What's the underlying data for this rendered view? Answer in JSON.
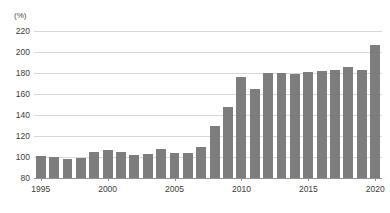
{
  "chart_data": {
    "type": "bar",
    "title": "",
    "subtitle": "",
    "xlabel": "",
    "ylabel": "",
    "unit_label": "(%)",
    "ylim": [
      80,
      220
    ],
    "ytick_values": [
      80,
      100,
      120,
      140,
      160,
      180,
      200,
      220
    ],
    "ytick_labels": [
      "80",
      "100",
      "120",
      "140",
      "160",
      "180",
      "200",
      "220"
    ],
    "xtick_values": [
      1995,
      2000,
      2005,
      2010,
      2015,
      2020
    ],
    "xtick_labels": [
      "1995",
      "2000",
      "2005",
      "2010",
      "2015",
      "2020"
    ],
    "grid": true,
    "legend": "none",
    "categories": [
      "1995",
      "1996",
      "1997",
      "1998",
      "1999",
      "2000",
      "2001",
      "2002",
      "2003",
      "2004",
      "2005",
      "2006",
      "2007",
      "2008",
      "2009",
      "2010",
      "2011",
      "2012",
      "2013",
      "2014",
      "2015",
      "2016",
      "2017",
      "2018",
      "2019",
      "2020"
    ],
    "values": [
      101,
      100,
      98,
      99,
      105,
      107,
      105,
      102,
      103,
      108,
      104,
      104,
      110,
      130,
      148,
      176,
      165,
      180,
      180,
      179,
      181,
      182,
      183,
      186,
      183,
      207
    ],
    "series": [
      {
        "name": "value",
        "color": "#7d7d7d",
        "values": [
          101,
          100,
          98,
          99,
          105,
          107,
          105,
          102,
          103,
          108,
          104,
          104,
          110,
          130,
          148,
          176,
          165,
          180,
          180,
          179,
          181,
          182,
          183,
          186,
          183,
          207
        ]
      }
    ]
  },
  "style": {
    "bar_color": "#7d7d7d",
    "grid_color": "#d8d8d8",
    "axis_color": "#8f8f8f",
    "text_color": "#3c3c3c",
    "background": "#ffffff"
  }
}
